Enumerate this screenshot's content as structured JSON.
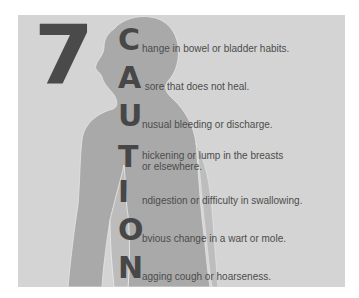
{
  "poster": {
    "number": "7",
    "acronym_items": [
      {
        "letter": "C",
        "text": "hange in bowel or bladder habits."
      },
      {
        "letter": "A",
        "text": " sore that does not heal."
      },
      {
        "letter": "U",
        "text": "nusual bleeding or discharge."
      },
      {
        "letter": "T",
        "text": "hickening or lump in the breasts\nor elsewhere."
      },
      {
        "letter": "I",
        "text": "ndigestion or difficulty in swallowing."
      },
      {
        "letter": "O",
        "text": "bvious change in a wart or mole."
      },
      {
        "letter": "N",
        "text": "agging cough or hoarseness."
      }
    ],
    "colors": {
      "background": "#d4d4d4",
      "silhouette": "#a9a9a9",
      "silhouette_arm": "#bcbcbc",
      "text": "#4c4c4c",
      "number": "#4a4a4a"
    }
  }
}
